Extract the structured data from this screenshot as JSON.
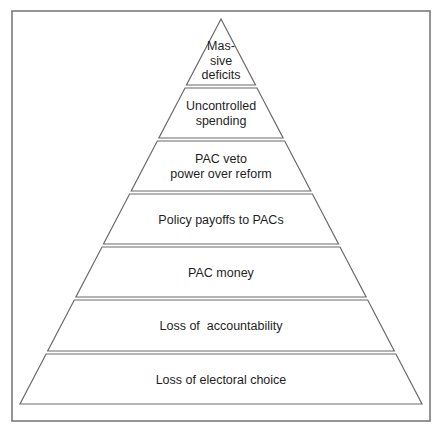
{
  "diagram": {
    "type": "pyramid",
    "frame": {
      "x": 12,
      "y": 11,
      "width": 418,
      "height": 410
    },
    "apex": {
      "x": 221,
      "y": 19
    },
    "base": {
      "y": 404,
      "left_x": 20,
      "right_x": 422
    },
    "colors": {
      "frame_stroke": "#7a7a7a",
      "band_stroke": "#6a6a6a",
      "band_fill": "#ffffff",
      "text": "#1e1e1e"
    },
    "levels": [
      {
        "order": 1,
        "position": "top",
        "lines": [
          "Mas-",
          "sive",
          "deficits"
        ],
        "y_top": 19,
        "y_bottom": 85
      },
      {
        "order": 2,
        "lines": [
          "Uncontrolled",
          "spending"
        ],
        "y_top": 88,
        "y_bottom": 138
      },
      {
        "order": 3,
        "lines": [
          "PAC veto",
          "power over reform"
        ],
        "y_top": 141,
        "y_bottom": 191
      },
      {
        "order": 4,
        "lines": [
          "Policy payoffs to PACs"
        ],
        "y_top": 194,
        "y_bottom": 244
      },
      {
        "order": 5,
        "lines": [
          "PAC money"
        ],
        "y_top": 247,
        "y_bottom": 297
      },
      {
        "order": 6,
        "lines": [
          "Loss of  accountability"
        ],
        "y_top": 300,
        "y_bottom": 351
      },
      {
        "order": 7,
        "position": "base",
        "lines": [
          "Loss of electoral choice"
        ],
        "y_top": 354,
        "y_bottom": 404
      }
    ]
  }
}
